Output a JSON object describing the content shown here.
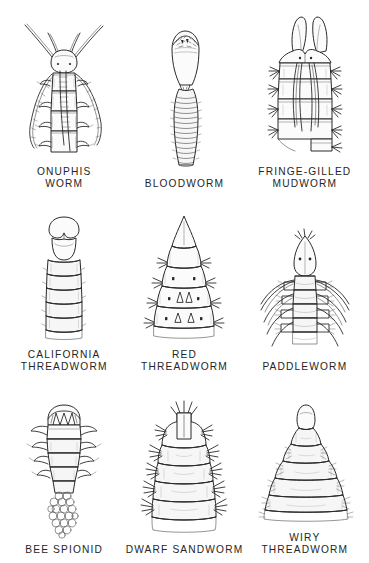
{
  "plate": {
    "title": "Marine worm head identification plate",
    "background_color": "#ffffff",
    "ink_color": "#2a2a2a",
    "caption_color": "#262626",
    "columns": 3,
    "rows": 3
  },
  "specimens": [
    {
      "id": "onuphis-worm",
      "label": "ONUPHIS\nWORM",
      "row": 1,
      "column": 1,
      "description": "Segmented head with five long tapering antennae and lateral parapodia"
    },
    {
      "id": "bloodworm",
      "label": "BLOODWORM",
      "row": 1,
      "column": 2,
      "description": "Bulbous everted proboscis above a finely ringed narrow body"
    },
    {
      "id": "fringe-gilled-mudworm",
      "label": "FRINGE-GILLED\nMUDWORM",
      "row": 1,
      "column": 3,
      "description": "Two large palps above segments bearing long gill filaments and bristle tufts"
    },
    {
      "id": "california-threadworm",
      "label": "CALIFORNIA\nTHREADWORM",
      "row": 2,
      "column": 1,
      "description": "Blunt notched head lobe on a smooth cylindrical ringed body"
    },
    {
      "id": "red-threadworm",
      "label": "RED\nTHREADWORM",
      "row": 2,
      "column": 2,
      "description": "Sharp conical prostomium above flaring tiered segments with bristles"
    },
    {
      "id": "paddleworm",
      "label": "PADDLEWORM",
      "row": 2,
      "column": 3,
      "description": "Pointed oval head with two eyes and sweeping paddle-shaped cirri"
    },
    {
      "id": "bee-spionid",
      "label": "BEE SPIONID",
      "row": 3,
      "column": 1,
      "description": "Crowned head and tapering body emerging from a tube of sand grains"
    },
    {
      "id": "dwarf-sandworm",
      "label": "DWARF SANDWORM",
      "row": 3,
      "column": 2,
      "description": "Barrel-shaped stacked segments with dark spiky bristle tufts each side"
    },
    {
      "id": "wiry-threadworm",
      "label": "WIRY\nTHREADWORM",
      "row": 3,
      "column": 3,
      "description": "Bell-shaped body of widening rings with fine marginal bristles"
    }
  ]
}
